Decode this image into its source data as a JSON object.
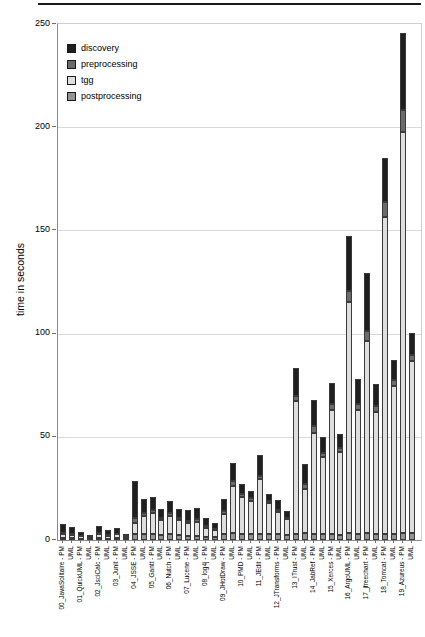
{
  "chart_data": {
    "type": "bar",
    "subtype": "stacked-vertical",
    "title": "",
    "ylabel": "time in seconds",
    "ylim": [
      0,
      250
    ],
    "yticks": [
      0,
      50,
      100,
      150,
      200,
      250
    ],
    "grid": true,
    "legend_position": "top-left-inside",
    "legend": [
      {
        "key": "discovery",
        "label": "discovery",
        "color": "#1f1f1f"
      },
      {
        "key": "preprocessing",
        "label": "preprocessing",
        "color": "#6b6b6b"
      },
      {
        "key": "tgg",
        "label": "tgg",
        "color": "#dedede"
      },
      {
        "key": "postprocessing",
        "label": "postprocessing",
        "color": "#949494"
      }
    ],
    "stack_order_bottom_to_top": [
      "postprocessing",
      "tgg",
      "preprocessing",
      "discovery"
    ],
    "bar_label_pm_suffix": " - PM",
    "bar_label_uml": "UML",
    "units": "seconds",
    "projects": [
      {
        "name": "00_JavaSolitaire",
        "pm": {
          "discovery": 4.4,
          "preprocessing": 0.5,
          "tgg": 1.7,
          "postprocessing": 1.0
        },
        "uml": {
          "discovery": 3.2,
          "preprocessing": 0.5,
          "tgg": 1.6,
          "postprocessing": 1.0
        }
      },
      {
        "name": "01_QuickUML",
        "pm": {
          "discovery": 1.9,
          "preprocessing": 0.3,
          "tgg": 1.2,
          "postprocessing": 0.5
        },
        "uml": {
          "discovery": 1.0,
          "preprocessing": 0.3,
          "tgg": 0.7,
          "postprocessing": 0.3
        }
      },
      {
        "name": "02_JsciCalc",
        "pm": {
          "discovery": 3.4,
          "preprocessing": 0.5,
          "tgg": 2.0,
          "postprocessing": 0.9
        },
        "uml": {
          "discovery": 2.4,
          "preprocessing": 0.4,
          "tgg": 1.5,
          "postprocessing": 0.6
        }
      },
      {
        "name": "03_Junit",
        "pm": {
          "discovery": 2.9,
          "preprocessing": 0.4,
          "tgg": 1.9,
          "postprocessing": 0.8
        },
        "uml": {
          "discovery": 1.4,
          "preprocessing": 0.3,
          "tgg": 1.0,
          "postprocessing": 0.4
        }
      },
      {
        "name": "04_JSSE",
        "pm": {
          "discovery": 18.0,
          "preprocessing": 2.5,
          "tgg": 5.1,
          "postprocessing": 3.0
        },
        "uml": {
          "discovery": 6.5,
          "preprocessing": 1.6,
          "tgg": 8.8,
          "postprocessing": 2.8
        }
      },
      {
        "name": "05_Gantt",
        "pm": {
          "discovery": 6.5,
          "preprocessing": 1.6,
          "tgg": 9.8,
          "postprocessing": 3.1
        },
        "uml": {
          "discovery": 4.0,
          "preprocessing": 1.1,
          "tgg": 7.4,
          "postprocessing": 2.4
        }
      },
      {
        "name": "06_Nutch",
        "pm": {
          "discovery": 5.7,
          "preprocessing": 1.6,
          "tgg": 8.8,
          "postprocessing": 2.8
        },
        "uml": {
          "discovery": 4.0,
          "preprocessing": 1.1,
          "tgg": 7.4,
          "postprocessing": 2.4
        }
      },
      {
        "name": "07_Lucene",
        "pm": {
          "discovery": 5.3,
          "preprocessing": 1.0,
          "tgg": 6.3,
          "postprocessing": 2.0
        },
        "uml": {
          "discovery": 5.7,
          "preprocessing": 1.1,
          "tgg": 6.9,
          "postprocessing": 2.0
        }
      },
      {
        "name": "08_log4j",
        "pm": {
          "discovery": 3.7,
          "preprocessing": 0.8,
          "tgg": 4.4,
          "postprocessing": 1.6
        },
        "uml": {
          "discovery": 3.0,
          "preprocessing": 0.6,
          "tgg": 3.4,
          "postprocessing": 1.4
        }
      },
      {
        "name": "09_JHotDraw",
        "pm": {
          "discovery": 5.7,
          "preprocessing": 1.6,
          "tgg": 9.7,
          "postprocessing": 2.8
        },
        "uml": {
          "discovery": 8.9,
          "preprocessing": 2.4,
          "tgg": 22.7,
          "postprocessing": 3.5
        }
      },
      {
        "name": "10_PMD",
        "pm": {
          "discovery": 5.2,
          "preprocessing": 1.3,
          "tgg": 17.8,
          "postprocessing": 3.0
        },
        "uml": {
          "discovery": 3.6,
          "preprocessing": 1.2,
          "tgg": 16.0,
          "postprocessing": 3.0
        }
      },
      {
        "name": "11_JEdit",
        "pm": {
          "discovery": 10.0,
          "preprocessing": 1.6,
          "tgg": 26.4,
          "postprocessing": 3.1
        },
        "uml": {
          "discovery": 3.5,
          "preprocessing": 1.0,
          "tgg": 15.0,
          "postprocessing": 2.7
        }
      },
      {
        "name": "12_JTransforms",
        "pm": {
          "discovery": 4.9,
          "preprocessing": 1.0,
          "tgg": 10.5,
          "postprocessing": 2.9
        },
        "uml": {
          "discovery": 3.2,
          "preprocessing": 0.8,
          "tgg": 7.6,
          "postprocessing": 2.5
        }
      },
      {
        "name": "13_ITrust",
        "pm": {
          "discovery": 13.4,
          "preprocessing": 2.4,
          "tgg": 64.6,
          "postprocessing": 2.9
        },
        "uml": {
          "discovery": 9.7,
          "preprocessing": 2.4,
          "tgg": 21.5,
          "postprocessing": 3.4
        }
      },
      {
        "name": "14_JabRef",
        "pm": {
          "discovery": 13.0,
          "preprocessing": 3.0,
          "tgg": 49.0,
          "postprocessing": 3.0
        },
        "uml": {
          "discovery": 8.0,
          "preprocessing": 2.0,
          "tgg": 37.0,
          "postprocessing": 3.0
        }
      },
      {
        "name": "15_Xerces",
        "pm": {
          "discovery": 10.0,
          "preprocessing": 3.0,
          "tgg": 60.0,
          "postprocessing": 3.0
        },
        "uml": {
          "discovery": 6.8,
          "preprocessing": 2.0,
          "tgg": 40.0,
          "postprocessing": 2.5
        }
      },
      {
        "name": "16_ArgoUML",
        "pm": {
          "discovery": 27.0,
          "preprocessing": 5.0,
          "tgg": 112.0,
          "postprocessing": 3.5
        },
        "uml": {
          "discovery": 12.0,
          "preprocessing": 3.0,
          "tgg": 60.0,
          "postprocessing": 3.0
        }
      },
      {
        "name": "17_jfreechart",
        "pm": {
          "discovery": 28.0,
          "preprocessing": 5.0,
          "tgg": 93.0,
          "postprocessing": 3.5
        },
        "uml": {
          "discovery": 10.7,
          "preprocessing": 3.0,
          "tgg": 59.0,
          "postprocessing": 3.0
        }
      },
      {
        "name": "18_Tomcat",
        "pm": {
          "discovery": 21.3,
          "preprocessing": 7.3,
          "tgg": 153.4,
          "postprocessing": 3.0
        },
        "uml": {
          "discovery": 9.7,
          "preprocessing": 2.5,
          "tgg": 71.8,
          "postprocessing": 3.0
        }
      },
      {
        "name": "19_Azureus",
        "pm": {
          "discovery": 37.4,
          "preprocessing": 10.7,
          "tgg": 194.0,
          "postprocessing": 3.5
        },
        "uml": {
          "discovery": 11.0,
          "preprocessing": 3.0,
          "tgg": 83.0,
          "postprocessing": 3.5
        }
      }
    ]
  }
}
